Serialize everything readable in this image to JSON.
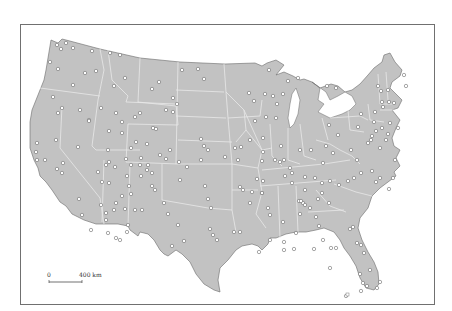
{
  "map": {
    "title": "",
    "land_color": "#c2c2c2",
    "border_color": "#e6e6e6",
    "coast_color": "#6a6a6a",
    "dot_fill": "#ffffff",
    "dot_stroke": "#555555"
  },
  "scale_bar": {
    "start_label": "0",
    "end_label": "400 km"
  },
  "points": [
    [
      57,
      45
    ],
    [
      61,
      49
    ],
    [
      66,
      43
    ],
    [
      73,
      48
    ],
    [
      92,
      51
    ],
    [
      110,
      53
    ],
    [
      120,
      55
    ],
    [
      50,
      62
    ],
    [
      58,
      69
    ],
    [
      85,
      73
    ],
    [
      96,
      71
    ],
    [
      114,
      86
    ],
    [
      125,
      78
    ],
    [
      152,
      89
    ],
    [
      159,
      82
    ],
    [
      198,
      69
    ],
    [
      182,
      70
    ],
    [
      204,
      79
    ],
    [
      73,
      85
    ],
    [
      53,
      97
    ],
    [
      62,
      108
    ],
    [
      58,
      113
    ],
    [
      80,
      110
    ],
    [
      89,
      120
    ],
    [
      101,
      108
    ],
    [
      109,
      131
    ],
    [
      122,
      122
    ],
    [
      122,
      133
    ],
    [
      116,
      113
    ],
    [
      135,
      117
    ],
    [
      140,
      113
    ],
    [
      173,
      98
    ],
    [
      177,
      104
    ],
    [
      166,
      110
    ],
    [
      173,
      112
    ],
    [
      153,
      128
    ],
    [
      156,
      129
    ],
    [
      136,
      142
    ],
    [
      56,
      140
    ],
    [
      37,
      143
    ],
    [
      36,
      152
    ],
    [
      37,
      160
    ],
    [
      45,
      160
    ],
    [
      57,
      169
    ],
    [
      63,
      163
    ],
    [
      62,
      173
    ],
    [
      78,
      147
    ],
    [
      89,
      121
    ],
    [
      98,
      172
    ],
    [
      108,
      150
    ],
    [
      109,
      162
    ],
    [
      115,
      167
    ],
    [
      106,
      165
    ],
    [
      126,
      159
    ],
    [
      131,
      148
    ],
    [
      141,
      158
    ],
    [
      140,
      165
    ],
    [
      131,
      165
    ],
    [
      148,
      165
    ],
    [
      147,
      170
    ],
    [
      152,
      173
    ],
    [
      141,
      176
    ],
    [
      127,
      176
    ],
    [
      102,
      182
    ],
    [
      109,
      183
    ],
    [
      101,
      205
    ],
    [
      106,
      213
    ],
    [
      114,
      210
    ],
    [
      106,
      220
    ],
    [
      116,
      203
    ],
    [
      122,
      196
    ],
    [
      125,
      209
    ],
    [
      128,
      225
    ],
    [
      127,
      232
    ],
    [
      108,
      233
    ],
    [
      116,
      238
    ],
    [
      120,
      240
    ],
    [
      79,
      199
    ],
    [
      82,
      215
    ],
    [
      91,
      230
    ],
    [
      129,
      186
    ],
    [
      152,
      186
    ],
    [
      155,
      190
    ],
    [
      131,
      194
    ],
    [
      135,
      210
    ],
    [
      142,
      210
    ],
    [
      170,
      150
    ],
    [
      147,
      144
    ],
    [
      160,
      155
    ],
    [
      166,
      159
    ],
    [
      179,
      162
    ],
    [
      180,
      180
    ],
    [
      187,
      167
    ],
    [
      201,
      160
    ],
    [
      204,
      146
    ],
    [
      201,
      139
    ],
    [
      208,
      150
    ],
    [
      205,
      186
    ],
    [
      208,
      199
    ],
    [
      225,
      157
    ],
    [
      235,
      148
    ],
    [
      238,
      160
    ],
    [
      241,
      147
    ],
    [
      250,
      140
    ],
    [
      211,
      208
    ],
    [
      240,
      187
    ],
    [
      243,
      190
    ],
    [
      252,
      192
    ],
    [
      250,
      203
    ],
    [
      262,
      161
    ],
    [
      257,
      179
    ],
    [
      263,
      181
    ],
    [
      262,
      193
    ],
    [
      262,
      193
    ],
    [
      268,
      208
    ],
    [
      270,
      215
    ],
    [
      292,
      183
    ],
    [
      305,
      177
    ],
    [
      305,
      190
    ],
    [
      315,
      178
    ],
    [
      322,
      183
    ],
    [
      330,
      181
    ],
    [
      322,
      193
    ],
    [
      318,
      199
    ],
    [
      329,
      203
    ],
    [
      339,
      185
    ],
    [
      348,
      181
    ],
    [
      354,
      178
    ],
    [
      361,
      173
    ],
    [
      372,
      171
    ],
    [
      376,
      182
    ],
    [
      380,
      178
    ],
    [
      389,
      189
    ],
    [
      393,
      178
    ],
    [
      395,
      160
    ],
    [
      380,
      148
    ],
    [
      368,
      143
    ],
    [
      357,
      160
    ],
    [
      351,
      150
    ],
    [
      333,
      153
    ],
    [
      326,
      146
    ],
    [
      323,
      163
    ],
    [
      311,
      150
    ],
    [
      300,
      150
    ],
    [
      281,
      146
    ],
    [
      275,
      160
    ],
    [
      284,
      160
    ],
    [
      280,
      162
    ],
    [
      290,
      168
    ],
    [
      285,
      176
    ],
    [
      292,
      173
    ],
    [
      255,
      121
    ],
    [
      266,
      117
    ],
    [
      263,
      138
    ],
    [
      263,
      152
    ],
    [
      276,
      118
    ],
    [
      277,
      104
    ],
    [
      283,
      94
    ],
    [
      273,
      96
    ],
    [
      265,
      94
    ],
    [
      254,
      101
    ],
    [
      249,
      93
    ],
    [
      269,
      70
    ],
    [
      288,
      81
    ],
    [
      298,
      78
    ],
    [
      327,
      86
    ],
    [
      336,
      88
    ],
    [
      329,
      125
    ],
    [
      338,
      135
    ],
    [
      361,
      114
    ],
    [
      374,
      122
    ],
    [
      358,
      127
    ],
    [
      372,
      136
    ],
    [
      376,
      131
    ],
    [
      382,
      128
    ],
    [
      388,
      134
    ],
    [
      398,
      128
    ],
    [
      390,
      123
    ],
    [
      383,
      107
    ],
    [
      375,
      112
    ],
    [
      381,
      91
    ],
    [
      378,
      86
    ],
    [
      388,
      90
    ],
    [
      404,
      75
    ],
    [
      406,
      86
    ],
    [
      394,
      103
    ],
    [
      389,
      102
    ],
    [
      382,
      102
    ],
    [
      371,
      140
    ],
    [
      386,
      140
    ],
    [
      299,
      201
    ],
    [
      303,
      203
    ],
    [
      300,
      214
    ],
    [
      310,
      208
    ],
    [
      316,
      217
    ],
    [
      319,
      226
    ],
    [
      323,
      240
    ],
    [
      331,
      248
    ],
    [
      336,
      248
    ],
    [
      330,
      268
    ],
    [
      350,
      229
    ],
    [
      353,
      227
    ],
    [
      357,
      243
    ],
    [
      361,
      245
    ],
    [
      364,
      253
    ],
    [
      370,
      270
    ],
    [
      360,
      274
    ],
    [
      363,
      283
    ],
    [
      361,
      291
    ],
    [
      377,
      288
    ],
    [
      380,
      282
    ],
    [
      367,
      286
    ],
    [
      346,
      296
    ],
    [
      284,
      250
    ],
    [
      294,
      249
    ],
    [
      314,
      249
    ],
    [
      283,
      222
    ],
    [
      301,
      201
    ],
    [
      305,
      205
    ],
    [
      296,
      233
    ],
    [
      284,
      242
    ],
    [
      270,
      240
    ],
    [
      259,
      252
    ],
    [
      240,
      232
    ],
    [
      234,
      232
    ],
    [
      213,
      235
    ],
    [
      210,
      229
    ],
    [
      184,
      241
    ],
    [
      172,
      246
    ],
    [
      178,
      225
    ],
    [
      168,
      214
    ],
    [
      164,
      203
    ],
    [
      217,
      240
    ]
  ]
}
